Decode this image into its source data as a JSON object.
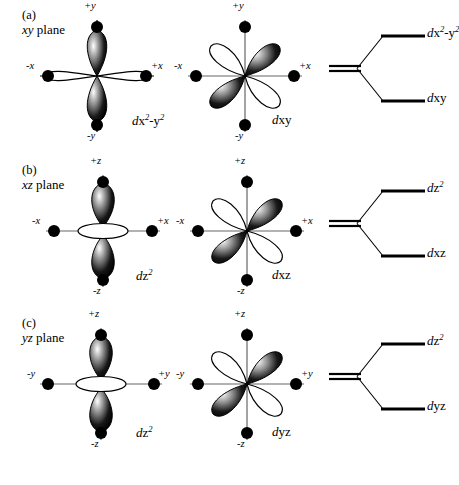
{
  "figure": {
    "ink_color": "#000000",
    "background": "#ffffff"
  },
  "panels": [
    {
      "tag": "(a)",
      "plane_italic": "xy",
      "plane_word": " plane",
      "axes": {
        "vertical_pos": "+y",
        "vertical_neg": "-y",
        "horizontal_neg": "-x",
        "horizontal_pos": "+x"
      },
      "orbitals": [
        {
          "name": "dx2-y2-orbital",
          "type": "cloverleaf-axial",
          "caption_d": "d",
          "caption_main": "x",
          "caption_sup1": "2",
          "caption_mid": "-y",
          "caption_sup2": "2"
        },
        {
          "name": "dxy-orbital",
          "type": "cloverleaf-diagonal",
          "caption_d": "d",
          "caption_main": "xy",
          "caption_sup1": "",
          "caption_mid": "",
          "caption_sup2": ""
        }
      ],
      "energy": {
        "upper_label_d": "d",
        "upper_label_main": "x",
        "upper_label_sup1": "2",
        "upper_label_mid": "-y",
        "upper_label_sup2": "2",
        "lower_label_d": "d",
        "lower_label_main": "xy",
        "lower_label_sup1": "",
        "lower_label_mid": "",
        "lower_label_sup2": ""
      }
    },
    {
      "tag": "(b)",
      "plane_italic": "xz",
      "plane_word": " plane",
      "axes": {
        "vertical_pos": "+z",
        "vertical_neg": "-z",
        "horizontal_neg": "-x",
        "horizontal_pos": "+x"
      },
      "orbitals": [
        {
          "name": "dz2-orbital",
          "type": "dumbbell-torus",
          "caption_d": "d",
          "caption_main": "z",
          "caption_sup1": "2",
          "caption_mid": "",
          "caption_sup2": ""
        },
        {
          "name": "dxz-orbital",
          "type": "cloverleaf-diagonal",
          "caption_d": "d",
          "caption_main": "xz",
          "caption_sup1": "",
          "caption_mid": "",
          "caption_sup2": ""
        }
      ],
      "energy": {
        "upper_label_d": "d",
        "upper_label_main": "z",
        "upper_label_sup1": "2",
        "upper_label_mid": "",
        "upper_label_sup2": "",
        "lower_label_d": "d",
        "lower_label_main": "xz",
        "lower_label_sup1": "",
        "lower_label_mid": "",
        "lower_label_sup2": ""
      }
    },
    {
      "tag": "(c)",
      "plane_italic": "yz",
      "plane_word": " plane",
      "axes": {
        "vertical_pos": "+z",
        "vertical_neg": "-z",
        "horizontal_neg": "-y",
        "horizontal_pos": "+y"
      },
      "orbitals": [
        {
          "name": "dz2-orbital",
          "type": "dumbbell-torus",
          "caption_d": "d",
          "caption_main": "z",
          "caption_sup1": "2",
          "caption_mid": "",
          "caption_sup2": ""
        },
        {
          "name": "dyz-orbital",
          "type": "cloverleaf-diagonal",
          "caption_d": "d",
          "caption_main": "yz",
          "caption_sup1": "",
          "caption_mid": "",
          "caption_sup2": ""
        }
      ],
      "energy": {
        "upper_label_d": "d",
        "upper_label_main": "z",
        "upper_label_sup1": "2",
        "upper_label_mid": "",
        "upper_label_sup2": "",
        "lower_label_d": "d",
        "lower_label_main": "yz",
        "lower_label_sup1": "",
        "lower_label_mid": "",
        "lower_label_sup2": ""
      }
    }
  ]
}
